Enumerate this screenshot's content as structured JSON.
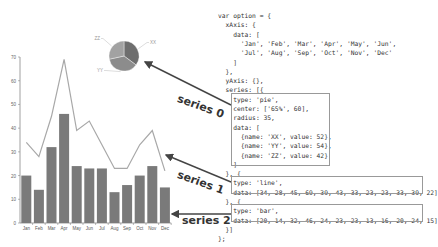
{
  "code": {
    "lines": [
      "var option = {",
      "  xAxis: {",
      "    data: [",
      "      'Jan', 'Feb', 'Mar', 'Apr', 'May', 'Jun',",
      "      'Jul', 'Aug', 'Sep', 'Oct', 'Nov', 'Dec'",
      "    ]",
      "  },",
      "  yAxis: {},",
      "  series: [{",
      "    type: 'pie',",
      "    center: ['65%', 60],",
      "    radius: 35,",
      "    data: [",
      "      {name: 'XX', value: 52},",
      "      {name: 'YY', value: 54},",
      "      {name: 'ZZ', value: 42}",
      "    ]",
      "  }, {",
      "    type: 'line',",
      "    data: [34, 28, 45, 69, 39, 43, 33, 23, 23, 33, 39, 22]",
      "  }, {",
      "    type: 'bar',",
      "    data: [20, 14, 32, 46, 24, 23, 23, 13, 16, 20, 24, 15]",
      "  }]",
      "};"
    ]
  },
  "annotations": {
    "series0": "series 0",
    "series1": "series 1",
    "series2": "series 2"
  },
  "colors": {
    "bar": "#7a7a7a",
    "line": "#a8a8a8",
    "pie": [
      "#6e6e6e",
      "#8c8c8c",
      "#a2a2a2"
    ],
    "arrow": "#444444",
    "box": "#999999"
  },
  "chart_data": [
    {
      "type": "bar",
      "title": "",
      "categories": [
        "Jan",
        "Feb",
        "Mar",
        "Apr",
        "May",
        "Jun",
        "Jul",
        "Aug",
        "Sep",
        "Oct",
        "Nov",
        "Dec"
      ],
      "series": [
        {
          "name": "series 1",
          "type": "line",
          "values": [
            34,
            28,
            45,
            69,
            39,
            43,
            33,
            23,
            23,
            33,
            39,
            22
          ]
        },
        {
          "name": "series 2",
          "type": "bar",
          "values": [
            20,
            14,
            32,
            46,
            24,
            23,
            23,
            13,
            16,
            20,
            24,
            15
          ]
        }
      ],
      "xlabel": "",
      "ylabel": "",
      "yticks": [
        0,
        10,
        20,
        30,
        40,
        50,
        60,
        70
      ],
      "ylim": [
        0,
        70
      ],
      "grid": false
    },
    {
      "type": "pie",
      "name": "series 0",
      "labels": [
        "XX",
        "YY",
        "ZZ"
      ],
      "values": [
        52,
        54,
        42
      ]
    }
  ]
}
